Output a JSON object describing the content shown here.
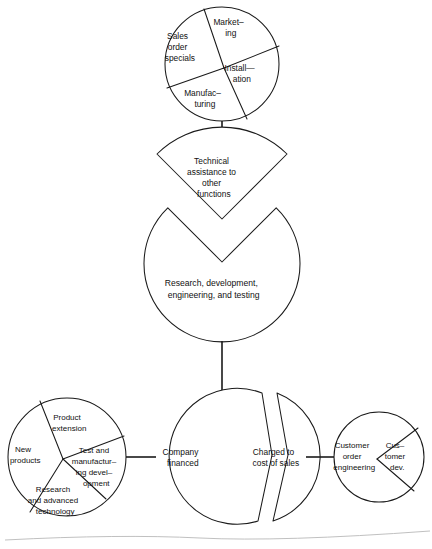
{
  "diagram": {
    "type": "exploded-pie-hierarchy",
    "stroke_color": "#1a1a1a",
    "fill_color": "#ffffff",
    "nodes": [
      {
        "id": "top-pie",
        "name": "Technical assistance recipients",
        "shape": "pie",
        "center": [
          222,
          64
        ],
        "radius": 57,
        "segments": [
          {
            "label_lines": [
              "Market–",
              "ing"
            ],
            "label_text": "Marketing",
            "label_pos": [
              239,
              26
            ]
          },
          {
            "label_lines": [
              "Install—",
              "ation"
            ],
            "label_text": "Installation",
            "label_pos": [
              250,
              73
            ]
          },
          {
            "label_lines": [
              "Manufac–",
              "turing"
            ],
            "label_text": "Manufacturing",
            "label_pos": [
              213,
              99
            ]
          },
          {
            "label_lines": [
              "Sales",
              "order",
              "specials"
            ],
            "label_text": "Sales order specials",
            "label_pos": [
              188,
              46
            ]
          }
        ]
      },
      {
        "id": "middle-wedge",
        "name": "Technical assistance wedge",
        "shape": "exploded-sector",
        "label_lines": [
          "Technical",
          "assistance to",
          "other",
          "functions"
        ],
        "label_text": "Technical assistance to other functions",
        "label_pos": [
          222,
          172
        ]
      },
      {
        "id": "middle-circle",
        "name": "Research and development circle",
        "shape": "notched-circle",
        "center": [
          222,
          263
        ],
        "radius": 78,
        "label_lines": [
          "Research, development,",
          "engineering, and testing"
        ],
        "label_text": "Research, development, engineering, and testing",
        "label_pos": [
          222,
          287
        ]
      },
      {
        "id": "bottom-left-pie",
        "name": "Company financed breakdown",
        "shape": "pie",
        "center": [
          67,
          457
        ],
        "radius": 59,
        "segments": [
          {
            "label_lines": [
              "Product",
              "extension"
            ],
            "label_text": "Product extension",
            "label_pos": [
              75,
              421
            ]
          },
          {
            "label_lines": [
              "Test and",
              "manufactur–",
              "ing devel–",
              "opment"
            ],
            "label_text": "Test and manufacturing development",
            "label_pos": [
              102,
              466
            ]
          },
          {
            "label_lines": [
              "Research",
              "and advanced",
              "technology"
            ],
            "label_text": "Research and advanced technology",
            "label_pos": [
              65,
              498
            ]
          },
          {
            "label_lines": [
              "New",
              "products"
            ],
            "label_text": "New products",
            "label_pos": [
              35,
              455
            ]
          }
        ]
      },
      {
        "id": "bottom-center-split",
        "name": "Funding source split circle",
        "shape": "split-circle",
        "center": [
          222,
          457
        ],
        "radius": 68,
        "segments": [
          {
            "label_lines": [
              "Company",
              "financed"
            ],
            "label_text": "Company financed",
            "label_pos": [
              192,
              457
            ]
          },
          {
            "label_lines": [
              "Charged to",
              "cost of sales"
            ],
            "label_text": "Charged to cost of sales",
            "label_pos": [
              283,
              457
            ]
          }
        ]
      },
      {
        "id": "bottom-right-pie",
        "name": "Cost of sales breakdown",
        "shape": "pie",
        "center": [
          379,
          457
        ],
        "radius": 45,
        "segments": [
          {
            "label_lines": [
              "Customer",
              "order",
              "engineering"
            ],
            "label_text": "Customer order engineering",
            "label_pos": [
              364,
              457
            ]
          },
          {
            "label_lines": [
              "Cus–",
              "tomer",
              "dev."
            ],
            "label_text": "Customer dev.",
            "label_pos": [
              404,
              457
            ]
          }
        ]
      }
    ],
    "connectors": [
      {
        "name": "top-pie-to-wedge",
        "from": "top-pie",
        "to": "middle-wedge",
        "orientation": "vertical",
        "x1": 222,
        "y1": 121,
        "x2": 222,
        "y2": 147
      },
      {
        "name": "middle-circle-to-split",
        "from": "middle-circle",
        "to": "bottom-center-split",
        "orientation": "vertical",
        "x1": 222,
        "y1": 341,
        "x2": 222,
        "y2": 390
      },
      {
        "name": "left-pie-to-split",
        "from": "bottom-left-pie",
        "to": "bottom-center-split",
        "orientation": "horizontal",
        "x1": 126,
        "y1": 457,
        "x2": 155,
        "y2": 457
      },
      {
        "name": "split-to-right-pie",
        "from": "bottom-center-split",
        "to": "bottom-right-pie",
        "orientation": "horizontal",
        "x1": 305,
        "y1": 457,
        "x2": 334,
        "y2": 457
      }
    ]
  }
}
